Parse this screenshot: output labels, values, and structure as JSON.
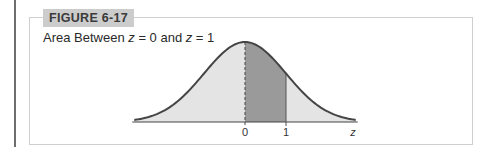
{
  "figure": {
    "label": "FIGURE 6-17",
    "caption_parts": [
      "Area Between ",
      "z",
      " = 0 and ",
      "z",
      " = 1"
    ]
  },
  "chart_data": {
    "type": "area",
    "title": "Area Between z = 0 and z = 1",
    "distribution": "standard normal",
    "xlabel": "z",
    "ylabel": "",
    "tick_labels": [
      "0",
      "1"
    ],
    "tick_values": [
      0,
      1
    ],
    "shaded_region": {
      "from": 0,
      "to": 1,
      "color": "#9a9a9a"
    },
    "background_fill": "#e4e4e4",
    "curve_color": "#444444",
    "x_range": [
      -2.7,
      2.7
    ],
    "dashed_line_at": 0,
    "grid": false,
    "legend": false
  }
}
